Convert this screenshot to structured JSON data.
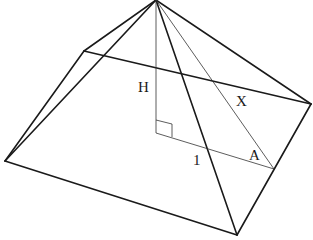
{
  "diagram": {
    "type": "square pyramid with height, slant height and apothem",
    "labels": {
      "height": "H",
      "slant": "X",
      "half_base": "1",
      "angle": "A"
    },
    "colors": {
      "stroke": "#1a1a1a",
      "background": "#ffffff"
    },
    "vertices": {
      "apex": [
        156,
        0
      ],
      "base_back_left": [
        84,
        51
      ],
      "base_right": [
        311,
        104
      ],
      "base_left": [
        5,
        161
      ],
      "base_front": [
        237,
        235
      ],
      "base_center": [
        156,
        133
      ],
      "edge_midpoint": [
        274,
        169
      ]
    }
  }
}
